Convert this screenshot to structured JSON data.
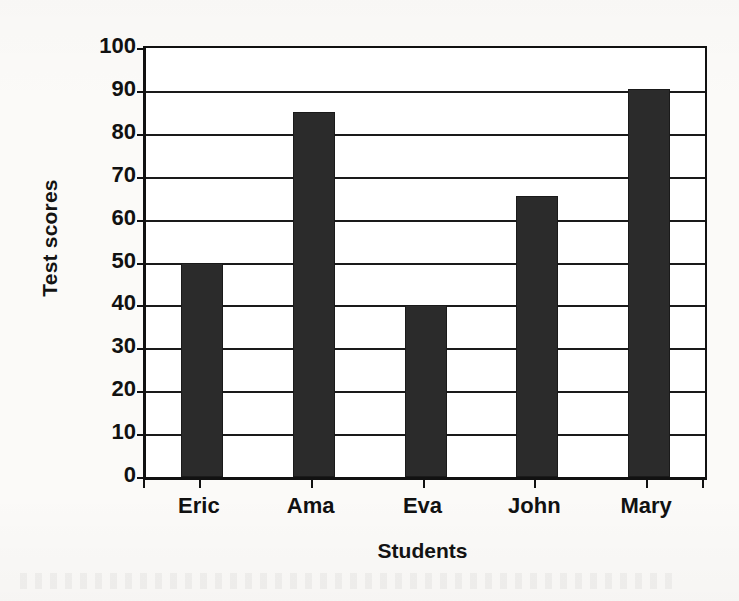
{
  "chart_data": {
    "type": "bar",
    "title": "",
    "subtitle": "",
    "xlabel": "Students",
    "ylabel": "Test scores",
    "categories": [
      "Eric",
      "Ama",
      "Eva",
      "John",
      "Mary"
    ],
    "values": [
      50,
      85,
      40,
      65.5,
      90.5
    ],
    "series": [
      {
        "name": "Test scores",
        "values": [
          50,
          85,
          40,
          65.5,
          90.5
        ]
      }
    ],
    "ylim": [
      0,
      100
    ],
    "ytick_values": [
      0,
      10,
      20,
      30,
      40,
      50,
      60,
      70,
      80,
      90,
      100
    ],
    "ytick_labels": [
      "0",
      "10",
      "20",
      "30",
      "40",
      "50",
      "60",
      "70",
      "80",
      "90",
      "100"
    ],
    "ytick_step": 10,
    "grid": true,
    "grid_axis": "y",
    "legend": false,
    "legend_position": "none",
    "bar_color": "#2b2b2b",
    "plot_background": "#ffffff",
    "figure_background": "#fbfaf8",
    "axis_color": "#111111",
    "text_color": "#111111",
    "annotations": []
  }
}
